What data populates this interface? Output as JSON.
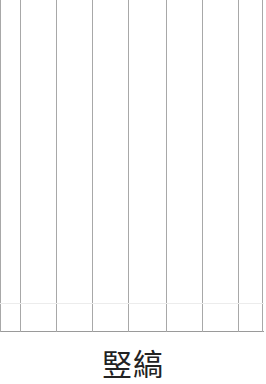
{
  "pattern": {
    "name": "vertical-stripes",
    "line_color": "#a8a8a8",
    "line_x_positions": [
      0,
      20,
      56,
      92,
      128,
      166,
      202,
      238,
      262
    ],
    "bottom_border_y": 331
  },
  "caption": {
    "text": "竪縞"
  }
}
